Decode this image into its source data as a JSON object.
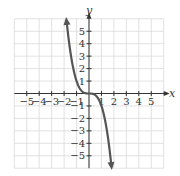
{
  "chart_data": {
    "type": "line",
    "title": "",
    "xlabel": "x",
    "ylabel": "y",
    "xlim": [
      -6,
      6
    ],
    "ylim": [
      -6,
      6
    ],
    "grid": true,
    "x_ticks": [
      -5,
      -4,
      -3,
      -2,
      -1,
      1,
      2,
      3,
      4,
      5
    ],
    "x_tick_labels": [
      "−5",
      "−4",
      "−3",
      "−2",
      "−1",
      "1",
      "2",
      "3",
      "4",
      "5"
    ],
    "y_ticks": [
      -5,
      -4,
      -3,
      -2,
      -1,
      1,
      2,
      3,
      4,
      5
    ],
    "y_tick_labels": [
      "−5",
      "−4",
      "−3",
      "−2",
      "−1",
      "1",
      "2",
      "3",
      "4",
      "5"
    ],
    "series": [
      {
        "name": "y = -x^3",
        "function": "-x^3",
        "x": [
          -1.8,
          -1.5,
          -1.25,
          -1,
          -0.75,
          -0.5,
          -0.25,
          0,
          0.25,
          0.5,
          0.75,
          1,
          1.25,
          1.5,
          1.8
        ],
        "y": [
          5.83,
          3.38,
          1.95,
          1,
          0.42,
          0.13,
          0.02,
          0,
          -0.02,
          -0.13,
          -0.42,
          -1,
          -1.95,
          -3.38,
          -5.83
        ],
        "arrows": "both-ends",
        "color": "#555555"
      }
    ],
    "legend": null
  },
  "style": {
    "grid_color": "#d9d9d9",
    "axis_color": "#333333",
    "curve_color": "#555555",
    "background": "#ffffff"
  }
}
